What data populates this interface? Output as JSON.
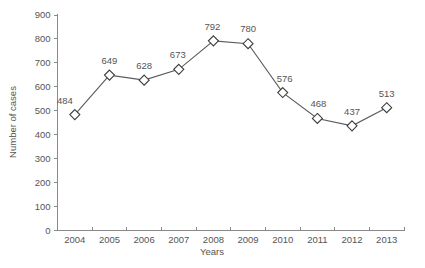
{
  "chart_data": {
    "type": "line",
    "title": "",
    "xlabel": "Years",
    "ylabel": "Number of cases",
    "categories": [
      "2004",
      "2005",
      "2006",
      "2007",
      "2008",
      "2009",
      "2010",
      "2011",
      "2012",
      "2013"
    ],
    "values": [
      484,
      649,
      628,
      673,
      792,
      780,
      576,
      468,
      437,
      513
    ],
    "series": [
      {
        "name": "Number of cases",
        "values": [
          484,
          649,
          628,
          673,
          792,
          780,
          576,
          468,
          437,
          513
        ]
      }
    ],
    "point_labels": [
      "484",
      "649",
      "628",
      "673",
      "792",
      "780",
      "576",
      "468",
      "437",
      "513"
    ],
    "ylim": [
      0,
      900
    ],
    "ytick_labels": [
      "0",
      "100",
      "200",
      "300",
      "400",
      "500",
      "600",
      "700",
      "800",
      "900"
    ],
    "ytick_values": [
      0,
      100,
      200,
      300,
      400,
      500,
      600,
      700,
      800,
      900
    ],
    "grid": false,
    "legend": false,
    "marker": "open-diamond",
    "colors": {
      "line": "#5b5b5b",
      "marker_fill": "#ffffff",
      "marker_stroke": "#3c3c3c",
      "axis": "#8a8a8a",
      "text": "#555555",
      "background": "#ffffff"
    }
  }
}
